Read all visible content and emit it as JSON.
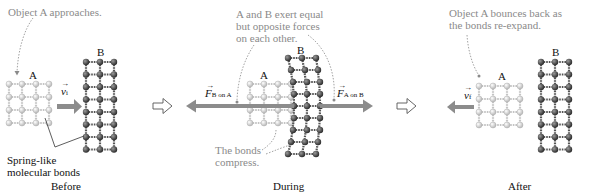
{
  "panels": [
    {
      "caption": "Before",
      "annotation": "Object A approaches.",
      "object_a_label": "A",
      "object_b_label": "B",
      "velocity_label": "v",
      "velocity_subscript": "i",
      "bonds_label_line1": "Spring-like",
      "bonds_label_line2": "molecular bonds"
    },
    {
      "caption": "During",
      "annotation_line1": "A and B exert equal",
      "annotation_line2": "but opposite forces",
      "annotation_line3": "on each other.",
      "object_a_label": "A",
      "object_b_label": "B",
      "force_left_label": "F",
      "force_left_subscript": "B on A",
      "force_right_label": "F",
      "force_right_subscript": "A on B",
      "compress_line1": "The bonds",
      "compress_line2": "compress."
    },
    {
      "caption": "After",
      "annotation_line1": "Object A bounces back as",
      "annotation_line2": "the bonds re-expand.",
      "object_a_label": "A",
      "object_b_label": "B",
      "velocity_label": "v",
      "velocity_subscript": "f"
    }
  ],
  "colors": {
    "light_atom": "#d0d0d0",
    "dark_atom": "#4a4a4a",
    "arrow": "#8c8c8c",
    "annotation": "#8a8a8a"
  }
}
